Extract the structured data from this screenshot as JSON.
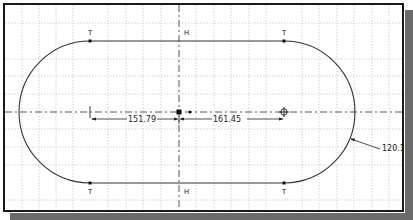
{
  "sketch": {
    "grid": {
      "spacing_px": 17.5,
      "visible": true
    },
    "constraints": {
      "tangent_labels": [
        "T",
        "T",
        "T",
        "T"
      ],
      "horizontal_labels": [
        "H",
        "H"
      ]
    },
    "dimensions": {
      "left_distance": "151.79",
      "right_distance": "161.45",
      "radius": "120.14"
    },
    "colors": {
      "geometry": "#333333",
      "centerline": "#444444",
      "grid": "#c8c8c8",
      "frame": "#1a1a1a",
      "shadow": "#6b6b6b"
    }
  }
}
